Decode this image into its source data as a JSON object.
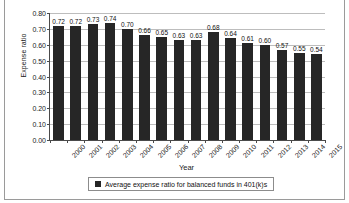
{
  "chart_data": {
    "type": "bar",
    "title": "",
    "xlabel": "Year",
    "ylabel": "Expense ratio",
    "ylim": [
      0.0,
      0.8
    ],
    "ytick_labels": [
      "0.80",
      "0.70",
      "0.60",
      "0.50",
      "0.40",
      "0.30",
      "0.20",
      "0.10",
      "0.00"
    ],
    "ytick_values": [
      0.8,
      0.7,
      0.6,
      0.5,
      0.4,
      0.3,
      0.2,
      0.1,
      0.0
    ],
    "grid": true,
    "legend_position": "bottom",
    "categories": [
      "2000",
      "2001",
      "2002",
      "2003",
      "2004",
      "2005",
      "2006",
      "2007",
      "2008",
      "2009",
      "2010",
      "2011",
      "2012",
      "2013",
      "2014",
      "2015"
    ],
    "values": [
      0.72,
      0.72,
      0.73,
      0.74,
      0.7,
      0.66,
      0.65,
      0.63,
      0.63,
      0.68,
      0.64,
      0.61,
      0.6,
      0.57,
      0.55,
      0.54
    ],
    "data_labels": [
      "0.72",
      "0.72",
      "0.73",
      "0.74",
      "0.70",
      "0.66",
      "0.65",
      "0.63",
      "0.63",
      "0.68",
      "0.64",
      "0.61",
      "0.60",
      "0.57",
      "0.55",
      "0.54"
    ],
    "series": [
      {
        "name": "Average expense ratio for balanced funds in 401(k)s",
        "color": "#262626",
        "values": [
          0.72,
          0.72,
          0.73,
          0.74,
          0.7,
          0.66,
          0.65,
          0.63,
          0.63,
          0.68,
          0.64,
          0.61,
          0.6,
          0.57,
          0.55,
          0.54
        ]
      }
    ]
  },
  "legend": {
    "entries": [
      {
        "label": "Average expense ratio for balanced funds in 401(k)s",
        "color": "#262626"
      }
    ]
  },
  "colors": {
    "bar": "#262626",
    "gridline": "#bdbdbd",
    "axis": "#4a4a4a",
    "text": "#1a1a1a",
    "background": "#ffffff",
    "frame": "#9a9a9a"
  }
}
